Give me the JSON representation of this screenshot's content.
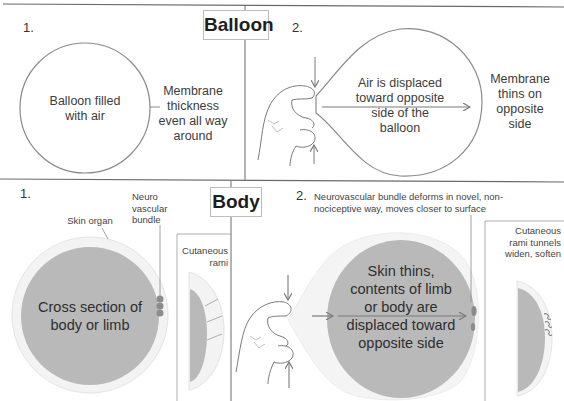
{
  "sections": {
    "balloon": {
      "title": "Balloon",
      "panel1": {
        "number": "1.",
        "inside_label": [
          "Balloon filled",
          "with air"
        ],
        "side_label": [
          "Membrane",
          "thickness",
          "even all way",
          "around"
        ]
      },
      "panel2": {
        "number": "2.",
        "inside_label": [
          "Air is displaced",
          "toward opposite",
          "side of the",
          "balloon"
        ],
        "side_label": [
          "Membrane",
          "thins on",
          "opposite",
          "side"
        ]
      }
    },
    "body": {
      "title": "Body",
      "panel1": {
        "number": "1.",
        "skin_label": "Skin organ",
        "bundle_label": [
          "Neuro",
          "vascular",
          "bundle"
        ],
        "inside_label": [
          "Cross section of",
          "body or limb"
        ],
        "inset_label": [
          "Cutaneous",
          "rami"
        ]
      },
      "panel2": {
        "number": "2.",
        "caption": [
          "Neurovascular bundle deforms in novel, non-",
          "nociceptive way, moves closer to surface"
        ],
        "inside_label": [
          "Skin thins,",
          "contents of limb",
          "or body are",
          "displaced toward",
          "opposite side"
        ],
        "inset_label": [
          "Cutaneous",
          "rami tunnels",
          "widen, soften"
        ]
      }
    }
  },
  "colors": {
    "line": "#7a7a7a",
    "tissue_fill": "#b9b9b9",
    "skin_fill": "#f1f1f1",
    "skin_stroke": "#e2e2e2",
    "bundle": "#8c8c8c",
    "divider": "#555555"
  }
}
